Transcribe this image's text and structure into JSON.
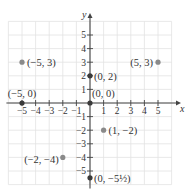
{
  "chart_data": {
    "type": "scatter",
    "title": "",
    "xlabel": "x",
    "ylabel": "y",
    "xlim": [
      -6,
      6
    ],
    "ylim": [
      -6,
      6
    ],
    "grid": true,
    "x_ticks": [
      -5,
      -4,
      -3,
      -2,
      -1,
      1,
      2,
      3,
      4,
      5
    ],
    "y_ticks": [
      -5,
      -4,
      -3,
      -2,
      -1,
      1,
      2,
      3,
      4,
      5
    ],
    "x_tick_labels": [
      "−5",
      "−4",
      "−3",
      "−2",
      "−1",
      "1",
      "2",
      "3",
      "4",
      "5"
    ],
    "y_tick_labels": [
      "−5",
      "−4",
      "−3",
      "−2",
      "−1",
      "1",
      "2",
      "3",
      "4",
      "5"
    ],
    "points": [
      {
        "x": -5,
        "y": 3,
        "label": "(−5, 3)",
        "on_axis": false
      },
      {
        "x": 5,
        "y": 3,
        "label": "(5, 3)",
        "on_axis": false
      },
      {
        "x": 0,
        "y": 2,
        "label": "(0, 2)",
        "on_axis": true
      },
      {
        "x": -5,
        "y": 0,
        "label": "(−5, 0)",
        "on_axis": true
      },
      {
        "x": 0,
        "y": 0,
        "label": "(0, 0)",
        "on_axis": true
      },
      {
        "x": 1,
        "y": -2,
        "label": "(1, −2)",
        "on_axis": false
      },
      {
        "x": -2,
        "y": -4,
        "label": "(−2, −4)",
        "on_axis": false
      },
      {
        "x": 0,
        "y": -5.5,
        "label": "(0, −5½)",
        "on_axis": true
      }
    ]
  },
  "colors": {
    "grid": "#e2e2e2",
    "axis": "#444444",
    "point_off_axis": "#8a8a8a",
    "point_on_axis": "#3a3a3a"
  }
}
